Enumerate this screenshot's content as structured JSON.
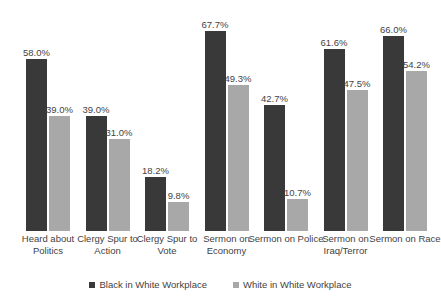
{
  "title_fragments": {
    "left": "",
    "mid": "",
    "right": ""
  },
  "legend": {
    "position": "bottom",
    "items": [
      {
        "label": "Black in White Workplace",
        "color": "#393939"
      },
      {
        "label": "White in White Workplace",
        "color": "#a8a8a8"
      }
    ]
  },
  "chart_data": {
    "type": "bar",
    "title": "",
    "xlabel": "",
    "ylabel": "",
    "ylim": [
      0,
      75
    ],
    "grid": false,
    "legend_position": "bottom",
    "value_suffix": "%",
    "categories": [
      "Heard about Politics",
      "Clergy Spur to Action",
      "Clergy Spur to Vote",
      "Sermon on Economy",
      "Sermon on Police",
      "Sermon on Iraq/Terror",
      "Sermon on Race"
    ],
    "series": [
      {
        "name": "Black in White Workplace",
        "color": "#393939",
        "values": [
          58.0,
          39.0,
          18.2,
          67.7,
          42.7,
          61.6,
          66.0
        ],
        "labels": [
          "58.0%",
          "39.0%",
          "18.2%",
          "67.7%",
          "42.7%",
          "61.6%",
          "66.0%"
        ]
      },
      {
        "name": "White in White Workplace",
        "color": "#a8a8a8",
        "values": [
          39.0,
          31.0,
          9.8,
          49.3,
          10.7,
          47.5,
          54.2
        ],
        "labels": [
          "39.0%",
          "31.0%",
          "9.8%",
          "49.3%",
          "10.7%",
          "47.5%",
          "54.2%"
        ]
      }
    ]
  }
}
